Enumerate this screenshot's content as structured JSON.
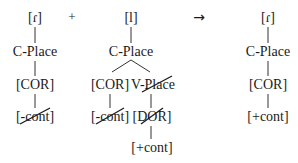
{
  "diagram": {
    "type": "feature-geometry-tree",
    "operator_plus": "+",
    "operator_arrow": "→",
    "left": {
      "segment": "[ɾ]",
      "node": "C-Place",
      "place": "[COR]",
      "feature": "[-cont]",
      "feature_delinked": true
    },
    "middle": {
      "segment": "[l]",
      "node": "C-Place",
      "place": "[COR]",
      "vplace": "V-Place",
      "vplace_delinked": true,
      "feature_cor": "[-cont]",
      "feature_cor_delinked": true,
      "dor": "[DOR]",
      "dor_delinked": true,
      "feature_dor": "[+cont]"
    },
    "right": {
      "segment": "[ɾ]",
      "node": "C-Place",
      "place": "[COR]",
      "feature": "[+cont]"
    },
    "colors": {
      "ink": "#1a1a1a",
      "background": "#ffffff"
    }
  }
}
